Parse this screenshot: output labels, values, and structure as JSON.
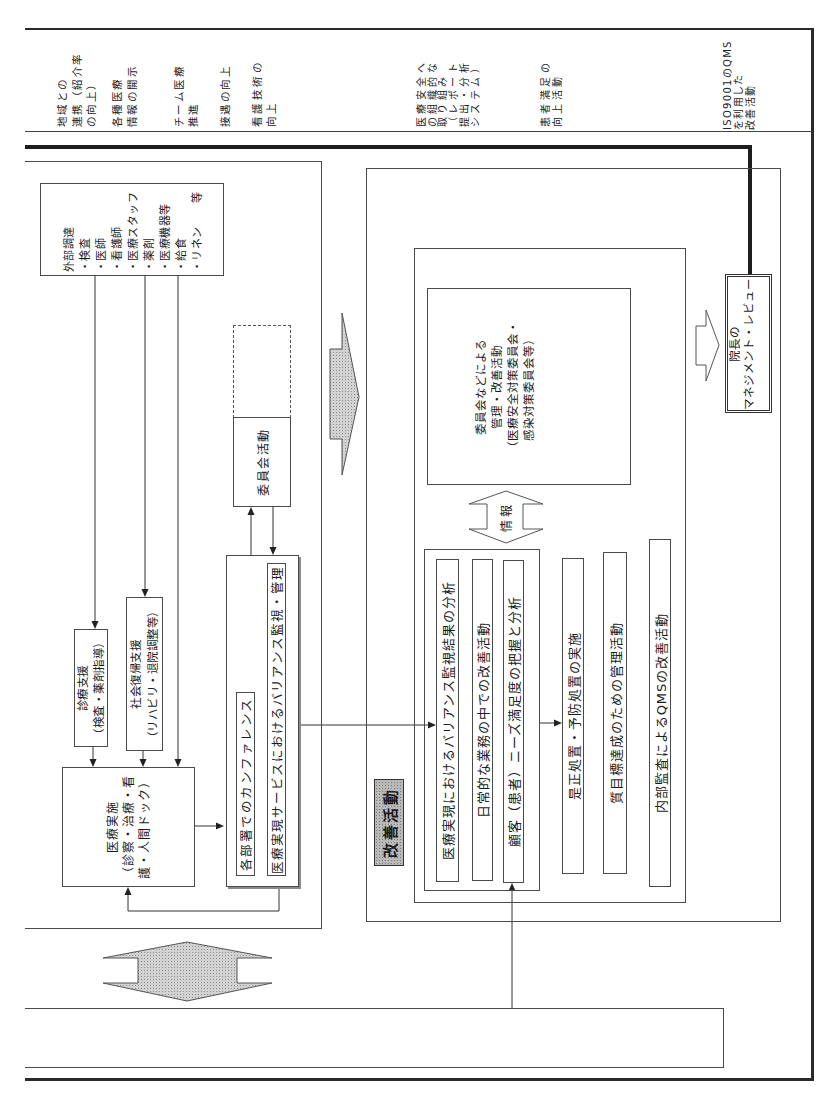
{
  "header": {
    "labels": [
      {
        "lines": [
          "地域との",
          "連携（紹介率",
          "の向上）"
        ]
      },
      {
        "lines": [
          "各種医療",
          "情報の開示"
        ]
      },
      {
        "lines": [
          "チーム医療",
          "推進"
        ]
      },
      {
        "lines": [
          "接遇の向上"
        ]
      },
      {
        "lines": [
          "看護技術の",
          "向上"
        ]
      },
      {
        "lines": [
          "医療安全へ",
          "の組織的な",
          "取り組み",
          "（レポート",
          "提出・分析",
          "システム）"
        ]
      },
      {
        "lines": [
          "患者満足の",
          "向上活動"
        ]
      },
      {
        "lines": [
          "ISO9001のQMS",
          "を利用した",
          "改善活動"
        ]
      }
    ]
  },
  "daily_operations": {
    "external_procurement": {
      "title": "外部調達",
      "items": [
        "・検査",
        "・医師",
        "・看護師",
        "・医療スタッフ",
        "・薬剤",
        "・医療機器等",
        "・給食",
        "・リネン　　等"
      ]
    },
    "medical_support": {
      "lines": [
        "診療支援",
        "（検査・薬剤指導）"
      ]
    },
    "social_rehab_support": {
      "lines": [
        "社会復帰支援",
        "（リハビリ・退院調整等）"
      ]
    },
    "medical_practice": {
      "lines": [
        "医療実施",
        "（診察・治療・看",
        "護・人間ドック）"
      ]
    },
    "conference_group": {
      "department_conference": "各部署でのカンファレンス",
      "variance_monitoring": "医療実現サービスにおけるバリアンス監視・管理"
    },
    "committee_activity": "委員会活動"
  },
  "improvement": {
    "label": "改善活動",
    "committee_management": {
      "lines": [
        "委員会などによる",
        "管理・改善活動",
        "（医療安全対策委員会・",
        "感染対策委員会等）"
      ]
    },
    "info_arrow_label": "情報",
    "activities": [
      "医療実現におけるバリアンス監視結果の分析",
      "日常的な業務の中での改善活動",
      "顧客（患者）ニーズ満足度の把握と分析",
      "是正処置・予防処置の実施",
      "質目標達成のための管理活動",
      "内部監査によるQMSの改善活動"
    ]
  },
  "management_review": {
    "lines": [
      "院長の",
      "マネジメント・レビュー"
    ]
  },
  "colors": {
    "line": "#333333",
    "thick_line": "#222222",
    "arrow_fill": "#c6c6c6",
    "label_fill": "#b9b9b9",
    "background": "#ffffff"
  }
}
